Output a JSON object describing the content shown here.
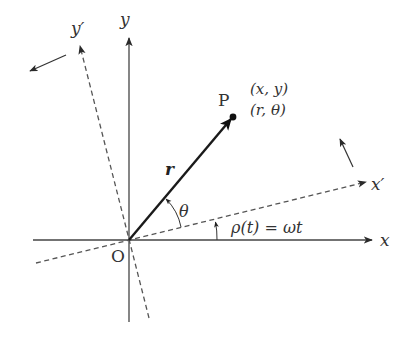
{
  "diagram": {
    "title": "",
    "colors": {
      "line": "#444444",
      "vector": "#1a1a1a",
      "dashed": "#555555",
      "background": "#ffffff"
    },
    "labels": {
      "x_axis": "x",
      "y_axis": "y",
      "x_prime_axis": "x′",
      "y_prime_axis": "y′",
      "origin": "O",
      "point": "P",
      "cartesian_coords": "(x, y)",
      "polar_coords": "(r, θ)",
      "vector": "r",
      "angle_theta": "θ",
      "rotation_angle": "ρ(t) = ωt"
    },
    "elements": [
      {
        "id": "x-axis",
        "type": "solid-arrow",
        "from": [
          33,
          240
        ],
        "to": [
          372,
          240
        ]
      },
      {
        "id": "y-axis",
        "type": "solid-arrow",
        "from": [
          129,
          322
        ],
        "to": [
          129,
          38
        ]
      },
      {
        "id": "x-prime-axis",
        "type": "dashed-arrow",
        "from": [
          36,
          263
        ],
        "to": [
          366,
          182
        ]
      },
      {
        "id": "y-prime-axis",
        "type": "dashed-arrow",
        "from": [
          149,
          318
        ],
        "to": [
          80,
          46
        ]
      },
      {
        "id": "position-vector",
        "type": "bold-arrow",
        "from": [
          129,
          240
        ],
        "to": [
          233,
          117
        ]
      },
      {
        "id": "rotation-arrow-x-prime",
        "type": "arrow",
        "from": [
          353,
          167
        ],
        "to": [
          339,
          138
        ]
      },
      {
        "id": "rotation-arrow-y-prime",
        "type": "arrow",
        "from": [
          66,
          55
        ],
        "to": [
          29,
          72
        ]
      }
    ]
  }
}
